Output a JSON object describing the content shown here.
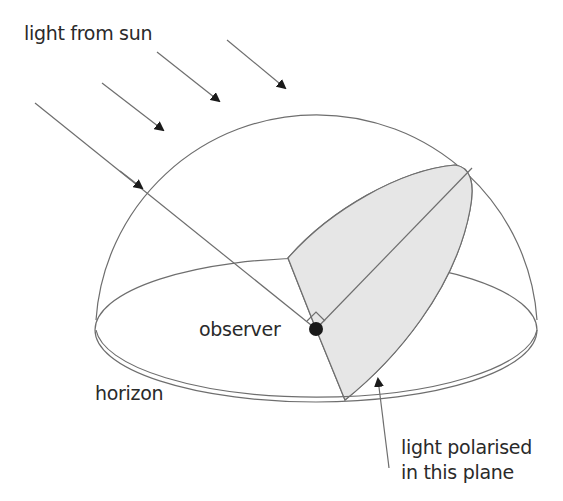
{
  "diagram": {
    "labels": {
      "sun": "light from sun",
      "observer": "observer",
      "horizon": "horizon",
      "plane_line1": "light polarised",
      "plane_line2": "in this plane"
    },
    "elements": {
      "dome": "hemisphere-of-sky",
      "horizon": "horizon-ellipse",
      "observer": "observer-dot",
      "sun_rays": 4,
      "polarisation_plane": "shaded-plane",
      "right_angle_marker": "perpendicular-marker"
    },
    "colors": {
      "line": "#6e6e6e",
      "shade": "#e6e6e6",
      "arrow": "#1a1a1a",
      "text": "#2a2a2a"
    }
  }
}
